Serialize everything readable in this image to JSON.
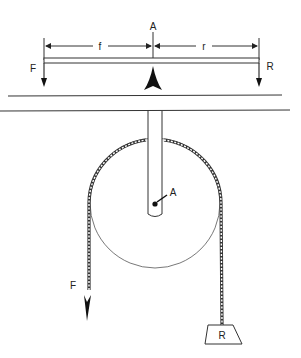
{
  "diagram": {
    "lever": {
      "fulcrum_label": "A",
      "effort_arm_label": "f",
      "resistance_arm_label": "r",
      "effort_force_label": "F",
      "resistance_force_label": "R"
    },
    "pulley": {
      "axle_label": "A",
      "effort_force_label": "F",
      "load_label": "R"
    }
  }
}
